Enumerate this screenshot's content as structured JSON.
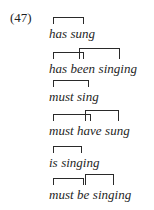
{
  "example": {
    "number": "(47)",
    "rows": [
      {
        "words": [
          "has",
          "sung"
        ],
        "links": [
          {
            "from": 0,
            "to": 1,
            "level": 0
          }
        ]
      },
      {
        "words": [
          "has",
          "been",
          "singing"
        ],
        "links": [
          {
            "from": 0,
            "to": 1,
            "level": 0
          },
          {
            "from": 1,
            "to": 2,
            "level": 1
          }
        ]
      },
      {
        "words": [
          "must",
          "sing"
        ],
        "links": [
          {
            "from": 0,
            "to": 1,
            "level": 0
          }
        ]
      },
      {
        "words": [
          "must",
          "have",
          "sung"
        ],
        "links": [
          {
            "from": 0,
            "to": 1,
            "level": 0
          },
          {
            "from": 1,
            "to": 2,
            "level": 1
          }
        ]
      },
      {
        "words": [
          "is",
          "singing"
        ],
        "links": [
          {
            "from": 0,
            "to": 1,
            "level": 0
          }
        ]
      },
      {
        "words": [
          "must",
          "be",
          "singing"
        ],
        "links": [
          {
            "from": 0,
            "to": 1,
            "level": 0
          },
          {
            "from": 1,
            "to": 2,
            "level": 1
          }
        ]
      }
    ]
  }
}
